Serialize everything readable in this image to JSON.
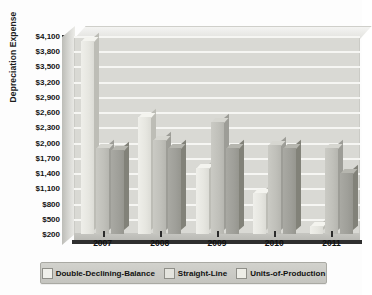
{
  "chart_data": {
    "type": "bar",
    "title": "",
    "xlabel": "",
    "ylabel": "Depreciation Expense",
    "categories": [
      "2007",
      "2008",
      "2009",
      "2010",
      "2011"
    ],
    "ylim": [
      200,
      4100
    ],
    "ytick_step": 300,
    "ytick_labels": [
      "$4,100",
      "$3,800",
      "$3,500",
      "$3,200",
      "$2,900",
      "$2,600",
      "$2,300",
      "$2,000",
      "$1,700",
      "$1,400",
      "$1,100",
      "$800",
      "$500",
      "$200"
    ],
    "ytick_values": [
      4100,
      3800,
      3500,
      3200,
      2900,
      2600,
      2300,
      2000,
      1700,
      1400,
      1100,
      800,
      500,
      200
    ],
    "grid": true,
    "legend_position": "bottom",
    "series": [
      {
        "name": "Double-Declining-Balance",
        "color": "#efefea",
        "values": [
          4000,
          2500,
          1500,
          1000,
          350
        ]
      },
      {
        "name": "Straight-Line",
        "color": "#c6c6c0",
        "values": [
          1900,
          2050,
          2400,
          1950,
          1900
        ]
      },
      {
        "name": "Units-of-Production",
        "color": "#a2a29c",
        "values": [
          1850,
          1900,
          1900,
          1900,
          1400
        ]
      }
    ]
  },
  "legend": {
    "items": [
      {
        "label": "Double-Declining-Balance"
      },
      {
        "label": "Straight-Line"
      },
      {
        "label": "Units-of-Production"
      }
    ]
  }
}
